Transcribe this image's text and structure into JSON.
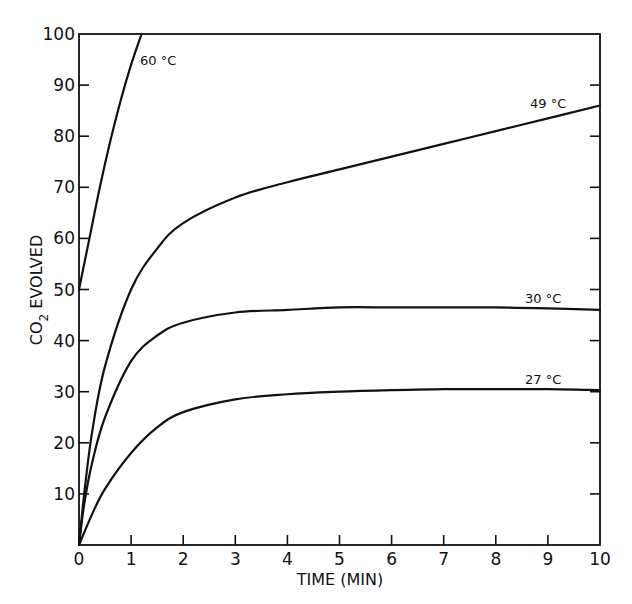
{
  "chart_data": {
    "type": "line",
    "title": "",
    "xlabel": "TIME (MIN)",
    "ylabel": "CO2 EVOLVED",
    "xlim": [
      0,
      10
    ],
    "ylim": [
      0,
      100
    ],
    "x_ticks": [
      "0",
      "1",
      "2",
      "3",
      "4",
      "5",
      "6",
      "7",
      "8",
      "9",
      "10"
    ],
    "y_ticks": [
      "10",
      "20",
      "30",
      "40",
      "50",
      "60",
      "70",
      "80",
      "90",
      "100"
    ],
    "grid": false,
    "legend": "inline labels at curve ends",
    "series": [
      {
        "name": "60 °C",
        "x": [
          0,
          0.2,
          0.4,
          0.6,
          0.8,
          1.0,
          1.2
        ],
        "values": [
          50,
          60,
          70,
          79,
          87,
          94,
          100
        ]
      },
      {
        "name": "49 °C",
        "x": [
          0,
          0.1,
          0.25,
          0.5,
          1,
          1.5,
          2,
          3,
          4,
          5,
          6,
          7,
          8,
          9,
          10
        ],
        "values": [
          0,
          10,
          22,
          35,
          50,
          58,
          63,
          68,
          71,
          73.5,
          76,
          78.5,
          81,
          83.5,
          86
        ]
      },
      {
        "name": "30 °C",
        "x": [
          0,
          0.1,
          0.25,
          0.5,
          1,
          1.5,
          2,
          3,
          4,
          5,
          6,
          7,
          8,
          9,
          10
        ],
        "values": [
          0,
          8,
          16,
          25,
          36,
          41,
          43.5,
          45.5,
          46,
          46.5,
          46.5,
          46.5,
          46.5,
          46.3,
          46
        ]
      },
      {
        "name": "27 °C",
        "x": [
          0,
          0.25,
          0.5,
          1,
          1.5,
          2,
          3,
          4,
          5,
          6,
          7,
          8,
          9,
          10
        ],
        "values": [
          0,
          6,
          11,
          18,
          23,
          26,
          28.5,
          29.5,
          30,
          30.3,
          30.5,
          30.5,
          30.5,
          30.3
        ]
      }
    ]
  },
  "labels": {
    "x_axis": "TIME (MIN)",
    "y_axis_main": "CO",
    "y_axis_sub": "2",
    "y_axis_rest": " EVOLVED",
    "series_60": "60 °C",
    "series_49": "49 °C",
    "series_30": "30 °C",
    "series_27": "27 °C"
  }
}
